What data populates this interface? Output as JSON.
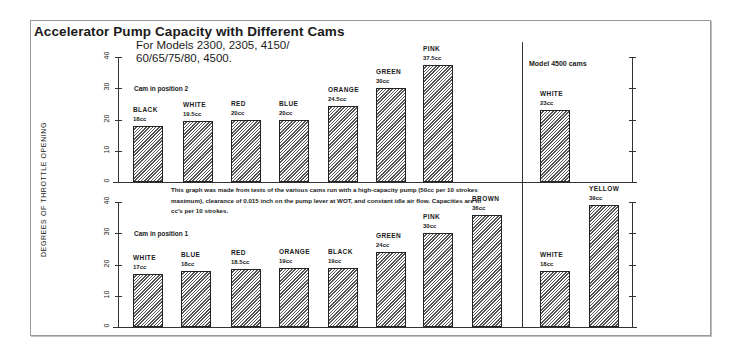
{
  "header": {
    "title": "Accelerator Pump Capacity with Different Cams",
    "subtitle_line1": "For Models 2300, 2305, 4150/",
    "subtitle_line2": "60/65/75/80, 4500."
  },
  "axis": {
    "ylabel": "DEGREES OF THROTTLE OPENING",
    "ticks": [
      "0",
      "10",
      "20",
      "30",
      "40"
    ]
  },
  "panels": {
    "top_label": "Cam in position 2",
    "bottom_label": "Cam in position 1",
    "model_label": "Model 4500 cams"
  },
  "note": "This graph was made from tests of the various cams run with a high-capacity pump (50cc per 10 strokes maximum), clearance of 0.015 inch on the pump lever at WOT, and constant idle air flow. Capacities are in cc's per 10 strokes.",
  "colors": {
    "bar_stroke": "#222222",
    "hatch": "#555555",
    "frame": "#9a9a9a"
  },
  "chart_data": [
    {
      "type": "bar",
      "title": "Cam in position 2 (Models 2300, 2305, 4150/60/65/75/80, 4500)",
      "ylabel": "Degrees of throttle opening",
      "ylim": [
        0,
        40
      ],
      "categories": [
        "BLACK",
        "WHITE",
        "RED",
        "BLUE",
        "ORANGE",
        "GREEN",
        "PINK"
      ],
      "values": [
        18,
        19.5,
        20,
        20,
        24.5,
        30,
        37.5
      ],
      "labels": [
        "18cc",
        "19.5cc",
        "20cc",
        "20cc",
        "24.5cc",
        "30cc",
        "37.5cc"
      ]
    },
    {
      "type": "bar",
      "title": "Model 4500 cams - Cam in position 2",
      "ylim": [
        0,
        40
      ],
      "categories": [
        "WHITE"
      ],
      "values": [
        23
      ],
      "labels": [
        "23cc"
      ]
    },
    {
      "type": "bar",
      "title": "Cam in position 1",
      "ylabel": "Degrees of throttle opening",
      "ylim": [
        0,
        40
      ],
      "categories": [
        "WHITE",
        "BLUE",
        "RED",
        "ORANGE",
        "BLACK",
        "GREEN",
        "PINK",
        "BROWN"
      ],
      "values": [
        17,
        18,
        18.5,
        19,
        19,
        24,
        30,
        36
      ],
      "labels": [
        "17cc",
        "18cc",
        "18.5cc",
        "19cc",
        "19cc",
        "24cc",
        "30cc",
        "36cc"
      ]
    },
    {
      "type": "bar",
      "title": "Model 4500 cams - Cam in position 1",
      "ylim": [
        0,
        40
      ],
      "categories": [
        "WHITE",
        "YELLOW"
      ],
      "values": [
        18,
        39
      ],
      "labels": [
        "18cc",
        "39cc"
      ]
    }
  ]
}
